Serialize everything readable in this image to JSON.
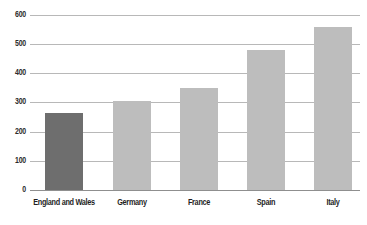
{
  "chart_data": {
    "type": "bar",
    "title": "",
    "subtitle": "",
    "xlabel": "",
    "ylabel": "",
    "categories": [
      "England and Wales",
      "Germany",
      "France",
      "Spain",
      "Italy"
    ],
    "values": [
      263,
      305,
      348,
      480,
      560
    ],
    "ylim": [
      0,
      600
    ],
    "ytick_labels": [
      "0",
      "100",
      "200",
      "300",
      "400",
      "500",
      "600"
    ],
    "ytick_values": [
      0,
      100,
      200,
      300,
      400,
      500,
      600
    ],
    "grid": true,
    "legend": "none",
    "bar_colors": [
      "#6e6e6e",
      "#bdbdbd",
      "#bdbdbd",
      "#bdbdbd",
      "#bdbdbd"
    ],
    "highlight_category": "England and Wales",
    "colors": {
      "highlight_bar": "#6e6e6e",
      "default_bar": "#bdbdbd",
      "gridline": "#b8b8b8",
      "axis": "#8f8f8f",
      "tick_text": "#2b2b2b",
      "category_text": "#1f1f1f",
      "background": "#ffffff"
    },
    "layout": {
      "plot_left": 30,
      "plot_right": 360,
      "baseline_y": 190,
      "top_y": 15,
      "px_per_unit": 0.2917,
      "bar_width": 38,
      "bar_left_positions": [
        45,
        113,
        180,
        247,
        314
      ]
    }
  }
}
